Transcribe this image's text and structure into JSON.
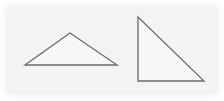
{
  "figure": {
    "background": "#f3f3f3",
    "stroke_color": "#6b6b6b",
    "shapes": [
      {
        "name": "obtuse-triangle",
        "points": "25,65 70,33 117,65"
      },
      {
        "name": "right-triangle",
        "points": "138,17 138,81 204,81"
      }
    ]
  }
}
